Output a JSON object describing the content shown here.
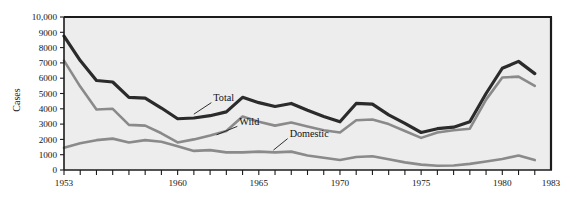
{
  "chart_data": {
    "type": "line",
    "title": "",
    "xlabel": "",
    "ylabel": "Cases",
    "xlim": [
      1953,
      1983
    ],
    "ylim": [
      0,
      10000
    ],
    "grid": false,
    "legend_position": "inline-annotations",
    "x": [
      1953,
      1954,
      1955,
      1956,
      1957,
      1958,
      1959,
      1960,
      1961,
      1962,
      1963,
      1964,
      1965,
      1966,
      1967,
      1968,
      1969,
      1970,
      1971,
      1972,
      1973,
      1974,
      1975,
      1976,
      1977,
      1978,
      1979,
      1980,
      1981,
      1982
    ],
    "x_tick_labels": [
      "1953",
      "1960",
      "1965",
      "1970",
      "1975",
      "1980",
      "1983"
    ],
    "x_tick_values": [
      1953,
      1960,
      1965,
      1970,
      1975,
      1980,
      1983
    ],
    "y_tick_labels": [
      "0",
      "1000",
      "2000",
      "3000",
      "4000",
      "5000",
      "6000",
      "7000",
      "8000",
      "9000",
      "10,000"
    ],
    "y_tick_values": [
      0,
      1000,
      2000,
      3000,
      4000,
      5000,
      6000,
      7000,
      8000,
      9000,
      10000
    ],
    "series": [
      {
        "name": "Total",
        "color": "#2b2b2b",
        "width": 3.2,
        "label_text": "Total",
        "values": [
          8750,
          7150,
          5850,
          5750,
          4750,
          4700,
          4050,
          3350,
          3400,
          3550,
          3800,
          4750,
          4400,
          4150,
          4350,
          3900,
          3500,
          3150,
          4350,
          4300,
          3600,
          3050,
          2450,
          2700,
          2800,
          3150,
          5000,
          6650,
          7100,
          6300
        ]
      },
      {
        "name": "Wild",
        "color": "#8a8a8a",
        "width": 2.6,
        "label_text": "Wild",
        "values": [
          7150,
          5450,
          3950,
          4000,
          2950,
          2900,
          2400,
          1800,
          2000,
          2250,
          2550,
          3500,
          3150,
          2900,
          3100,
          2850,
          2600,
          2450,
          3250,
          3300,
          3000,
          2550,
          2100,
          2450,
          2600,
          2700,
          4600,
          6050,
          6100,
          5500
        ]
      },
      {
        "name": "Domestic",
        "color": "#8a8a8a",
        "width": 2.6,
        "label_text": "Domestic",
        "values": [
          1450,
          1750,
          1950,
          2050,
          1800,
          1950,
          1850,
          1550,
          1250,
          1300,
          1150,
          1150,
          1200,
          1150,
          1200,
          950,
          800,
          650,
          850,
          900,
          700,
          500,
          350,
          280,
          290,
          400,
          560,
          720,
          950,
          650
        ]
      }
    ],
    "annotations": [
      {
        "text": "Total",
        "x": 1962.2,
        "y": 4500,
        "leader_to_x": 1961.0,
        "leader_to_y": 3650
      },
      {
        "text": "Wild",
        "x": 1963.8,
        "y": 2950,
        "leader_to_x": 1962.4,
        "leader_to_y": 2300
      },
      {
        "text": "Domestic",
        "x": 1966.9,
        "y": 2150,
        "leader_to_x": 1965.9,
        "leader_to_y": 1300
      }
    ]
  },
  "style": {
    "plot_background": "#ededed",
    "border_color": "#1b1b1b",
    "page_background": "#ffffff"
  }
}
